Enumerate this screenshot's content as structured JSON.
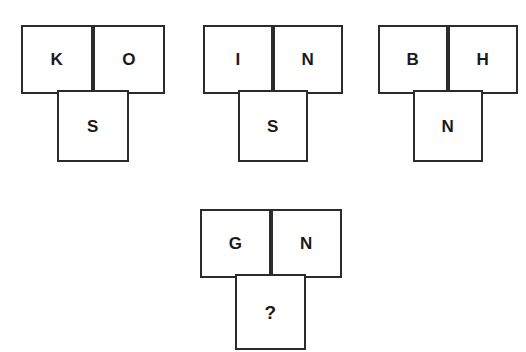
{
  "page": {
    "background_color": "#ffffff",
    "stroke_color": "#2b2b2b",
    "text_color": "#1a1a1a",
    "width": 526,
    "height": 352
  },
  "puzzle": {
    "type": "letter-analogy",
    "figure_shape": "T-shape: two cells side by side on top, one cell centered below",
    "unknown_marker": "?",
    "groups": [
      {
        "id": "group-1",
        "top_left": "K",
        "top_right": "O",
        "bottom": "S",
        "position": {
          "x": 21,
          "y": 25
        },
        "cell_width": 72,
        "cell_height": 69
      },
      {
        "id": "group-2",
        "top_left": "I",
        "top_right": "N",
        "bottom": "S",
        "position": {
          "x": 203,
          "y": 25
        },
        "cell_width": 69,
        "cell_height": 69
      },
      {
        "id": "group-3",
        "top_left": "B",
        "top_right": "H",
        "bottom": "N",
        "position": {
          "x": 378,
          "y": 25
        },
        "cell_width": 70,
        "cell_height": 69
      },
      {
        "id": "group-4",
        "top_left": "G",
        "top_right": "N",
        "bottom": "?",
        "position": {
          "x": 200,
          "y": 209
        },
        "cell_width": 71,
        "cell_height": 69
      }
    ]
  }
}
